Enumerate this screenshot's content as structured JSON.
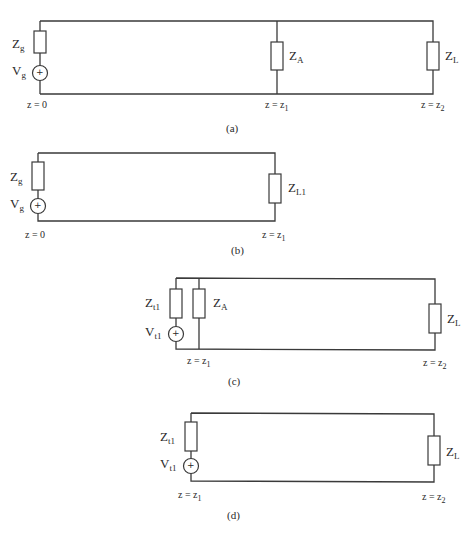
{
  "figures": [
    {
      "id": "a",
      "caption": "(a)",
      "labels": {
        "zg": {
          "main": "Z",
          "sub": "g"
        },
        "vg": {
          "main": "V",
          "sub": "g"
        },
        "za": {
          "main": "Z",
          "sub": "A"
        },
        "zl": {
          "main": "Z",
          "sub": "L"
        },
        "pos0": {
          "main": "z = 0",
          "sub": ""
        },
        "pos1": {
          "main": "z = z",
          "sub": "1"
        },
        "pos2": {
          "main": "z = z",
          "sub": "2"
        }
      },
      "source_symbol": "+"
    },
    {
      "id": "b",
      "caption": "(b)",
      "labels": {
        "zg": {
          "main": "Z",
          "sub": "g"
        },
        "vg": {
          "main": "V",
          "sub": "g"
        },
        "zl1": {
          "main": "Z",
          "sub": "L1"
        },
        "pos0": {
          "main": "z = 0",
          "sub": ""
        },
        "pos1": {
          "main": "z = z",
          "sub": "1"
        }
      },
      "source_symbol": "+"
    },
    {
      "id": "c",
      "caption": "(c)",
      "labels": {
        "zt1": {
          "main": "Z",
          "sub": "t1"
        },
        "vt1": {
          "main": "V",
          "sub": "t1"
        },
        "za": {
          "main": "Z",
          "sub": "A"
        },
        "zl": {
          "main": "Z",
          "sub": "L"
        },
        "pos1": {
          "main": "z = z",
          "sub": "1"
        },
        "pos2": {
          "main": "z = z",
          "sub": "2"
        }
      },
      "source_symbol": "+"
    },
    {
      "id": "d",
      "caption": "(d)",
      "labels": {
        "zt1": {
          "main": "Z",
          "sub": "t1"
        },
        "vt1": {
          "main": "V",
          "sub": "t1"
        },
        "zl": {
          "main": "Z",
          "sub": "L"
        },
        "pos1": {
          "main": "z = z",
          "sub": "1"
        },
        "pos2": {
          "main": "z = z",
          "sub": "2"
        }
      },
      "source_symbol": "+"
    }
  ],
  "colors": {
    "line": "#3a3a3a",
    "text": "#2a2a2a",
    "background": "#ffffff"
  }
}
